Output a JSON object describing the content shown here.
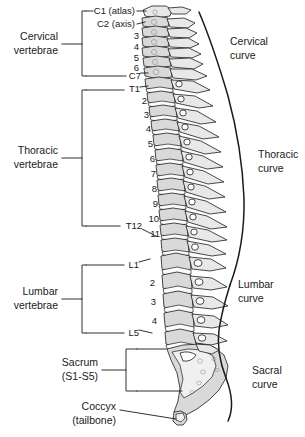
{
  "figure": {
    "background_color": "#ffffff",
    "line_color": "#1a1a1a",
    "bone_fill": "#d9d9d9"
  },
  "region_labels": [
    {
      "id": "cervical",
      "line1": "Cervical",
      "line2": "vertebrae"
    },
    {
      "id": "thoracic",
      "line1": "Thoracic",
      "line2": "vertebrae"
    },
    {
      "id": "lumbar",
      "line1": "Lumbar",
      "line2": "vertebrae"
    },
    {
      "id": "sacrum",
      "line1": "Sacrum",
      "line2": "(S1-S5)"
    },
    {
      "id": "coccyx",
      "line1": "Coccyx",
      "line2": "(tailbone)"
    }
  ],
  "curve_labels": [
    {
      "id": "cervical-curve",
      "line1": "Cervical",
      "line2": "curve"
    },
    {
      "id": "thoracic-curve",
      "line1": "Thoracic",
      "line2": "curve"
    },
    {
      "id": "lumbar-curve",
      "line1": "Lumbar",
      "line2": "curve"
    },
    {
      "id": "sacral-curve",
      "line1": "Sacral",
      "line2": "curve"
    }
  ],
  "vertebra_labels": {
    "cervical": [
      {
        "text": "C1 (atlas)",
        "leader": true
      },
      {
        "text": "C2 (axis)",
        "leader": true
      },
      {
        "text": "3",
        "leader": false
      },
      {
        "text": "4",
        "leader": false
      },
      {
        "text": "5",
        "leader": false
      },
      {
        "text": "6",
        "leader": false
      },
      {
        "text": "C7",
        "leader": true
      }
    ],
    "thoracic": [
      {
        "text": "T1",
        "leader": true
      },
      {
        "text": "2",
        "leader": false
      },
      {
        "text": "3",
        "leader": false
      },
      {
        "text": "4",
        "leader": false
      },
      {
        "text": "5",
        "leader": false
      },
      {
        "text": "6",
        "leader": false
      },
      {
        "text": "7",
        "leader": false
      },
      {
        "text": "8",
        "leader": false
      },
      {
        "text": "9",
        "leader": false
      },
      {
        "text": "10",
        "leader": false
      },
      {
        "text": "11",
        "leader": false
      },
      {
        "text": "T12",
        "leader": true
      }
    ],
    "lumbar": [
      {
        "text": "L1",
        "leader": true
      },
      {
        "text": "2",
        "leader": false
      },
      {
        "text": "3",
        "leader": false
      },
      {
        "text": "4",
        "leader": false
      },
      {
        "text": "L5",
        "leader": true
      }
    ]
  }
}
